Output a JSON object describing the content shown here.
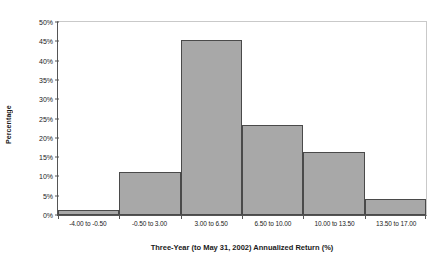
{
  "chart_data": {
    "type": "bar",
    "title": "",
    "subtitle": "",
    "xlabel": "Three-Year (to May 31, 2002) Annualized Return (%)",
    "ylabel": "Percentage",
    "categories": [
      "-4.00 to -0.50",
      "-0.50 to 3.00",
      "3.00 to 6.50",
      "6.50 to 10.00",
      "10.00 to 13.50",
      "13.50 to 17.00"
    ],
    "values": [
      1,
      11,
      45,
      23,
      16,
      4
    ],
    "value_labels": [
      "1%",
      "11%",
      "45%",
      "23%",
      "16%",
      "4%"
    ],
    "ylim": [
      0,
      50
    ],
    "ytick_values": [
      0,
      5,
      10,
      15,
      20,
      25,
      30,
      35,
      40,
      45,
      50
    ],
    "ytick_labels": [
      "0%",
      "5%",
      "10%",
      "15%",
      "20%",
      "25%",
      "30%",
      "35%",
      "40%",
      "45%",
      "50%"
    ],
    "grid": false,
    "legend": false,
    "legend_position": "none",
    "bar_gap": 0,
    "colors": {
      "bar_fill": "#a8a8a8",
      "bar_edge": "#4a4a4a",
      "axis_line": "#555555",
      "frame_line": "#c9c9c9",
      "text": "#1a1a1a",
      "background": "#ffffff"
    }
  }
}
